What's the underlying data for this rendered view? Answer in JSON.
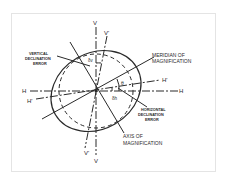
{
  "diagram": {
    "axis_labels": {
      "v_top": "V",
      "v_prime_top": "V'",
      "v_bottom": "V",
      "v_prime_bottom": "V'",
      "h_left": "H",
      "h_right": "H",
      "h_prime_left": "H'",
      "h_prime_right": "H'"
    },
    "annotations": {
      "vertical_error_line1": "VERTICAL",
      "vertical_error_line2": "DECLINATION",
      "vertical_error_line3": "ERROR",
      "meridian_line1": "MERIDIAN OF",
      "meridian_line2": "MAGNIFICATION",
      "horizontal_error_line1": "HORIZONTAL",
      "horizontal_error_line2": "DECLINATION",
      "horizontal_error_line3": "ERROR",
      "axis_line1": "AXIS OF",
      "axis_line2": "MAGNIFICATION"
    },
    "angle_labels": {
      "theta": "θ",
      "delta_v": "δv",
      "delta_h": "δh"
    },
    "colors": {
      "ink": "#2a2a2a",
      "frame": "#e4e4e4",
      "background": "#ffffff"
    }
  }
}
